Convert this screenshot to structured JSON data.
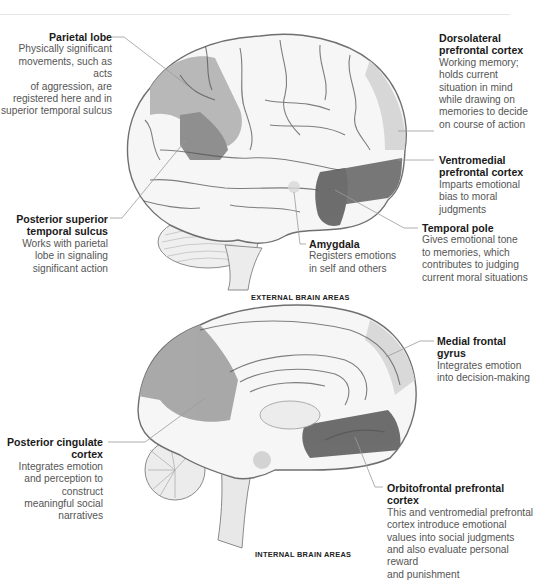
{
  "colors": {
    "highlight_light": "#b4b4b4",
    "highlight_mid": "#8f8f8f",
    "highlight_dark": "#6e6e6e",
    "leader_line": "#9a9a9a",
    "title_text": "#1a1a1a",
    "body_text": "#555555"
  },
  "external": {
    "caption": "EXTERNAL BRAIN AREAS",
    "labels": [
      {
        "id": "parietal-lobe",
        "title": "Parietal lobe",
        "desc": [
          "Physically significant",
          "movements, such as acts",
          "of aggression, are",
          "registered here and in",
          "superior temporal sulcus"
        ]
      },
      {
        "id": "dorsolateral-prefrontal-cortex",
        "title": [
          "Dorsolateral",
          "prefrontal cortex"
        ],
        "desc": [
          "Working memory;",
          "holds current",
          "situation in mind",
          "while drawing on",
          "memories to decide",
          "on course of action"
        ]
      },
      {
        "id": "ventromedial-prefrontal-cortex",
        "title": [
          "Ventromedial",
          "prefrontal cortex"
        ],
        "desc": [
          "Imparts emotional",
          "bias to moral",
          "judgments"
        ]
      },
      {
        "id": "posterior-superior-temporal-sulcus",
        "title": [
          "Posterior superior",
          "temporal sulcus"
        ],
        "desc": [
          "Works with parietal",
          "lobe in signaling",
          "significant action"
        ]
      },
      {
        "id": "temporal-pole",
        "title": "Temporal pole",
        "desc": [
          "Gives emotional tone",
          "to memories, which",
          "contributes to judging",
          "current moral situations"
        ]
      },
      {
        "id": "amygdala",
        "title": "Amygdala",
        "desc": [
          "Registers emotions",
          "in self and others"
        ]
      }
    ]
  },
  "internal": {
    "caption": "INTERNAL BRAIN AREAS",
    "labels": [
      {
        "id": "medial-frontal-gyrus",
        "title": [
          "Medial frontal",
          "gyrus"
        ],
        "desc": [
          "Integrates emotion",
          "into decision-making"
        ]
      },
      {
        "id": "posterior-cingulate-cortex",
        "title": [
          "Posterior cingulate",
          "cortex"
        ],
        "desc": [
          "Integrates emotion",
          "and perception to",
          "construct",
          "meaningful social",
          "narratives"
        ]
      },
      {
        "id": "orbitofrontal-prefrontal-cortex",
        "title": [
          "Orbitofrontal prefrontal",
          "cortex"
        ],
        "desc": [
          "This and ventromedial prefrontal",
          "cortex introduce emotional",
          "values into social judgments",
          "and also evaluate personal reward",
          "and punishment"
        ]
      }
    ]
  }
}
